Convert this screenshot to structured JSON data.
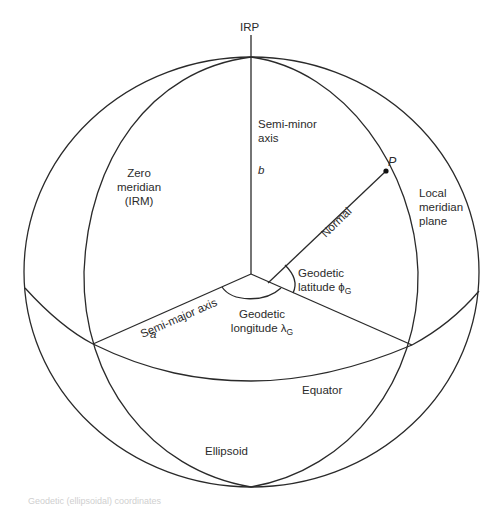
{
  "diagram": {
    "labels": {
      "irp": "IRP",
      "semi_minor_axis": [
        "Semi-minor",
        "axis"
      ],
      "b": "b",
      "p": "P",
      "zero_meridian": [
        "Zero",
        "meridian",
        "(IRM)"
      ],
      "local_meridian_plane": [
        "Local",
        "meridian",
        "plane"
      ],
      "normal": "Normal",
      "geodetic_latitude": {
        "line1": "Geodetic",
        "line2": "latitude",
        "symbol": "ϕ",
        "subscript": "G"
      },
      "geodetic_longitude": {
        "line1": "Geodetic",
        "line2": "longitude",
        "symbol": "λ",
        "subscript": "G"
      },
      "semi_major_axis": "Semi-major axis",
      "a": "a",
      "equator": "Equator",
      "ellipsoid": "Ellipsoid"
    },
    "caption_faded": "Geodetic (ellipsoidal) coordinates",
    "colors": {
      "line": "#2a2a2a",
      "text": "#2b2b2b",
      "background": "#ffffff"
    }
  }
}
